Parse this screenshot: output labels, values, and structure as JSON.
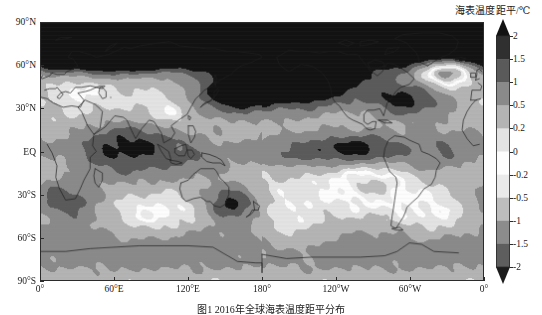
{
  "figure": {
    "caption": "图1  2016年全球海表温度距平分布",
    "colorbar_title": "海表温度距平/℃"
  },
  "axes": {
    "y_ticks": [
      {
        "label": "90°N",
        "value": 90
      },
      {
        "label": "60°N",
        "value": 60
      },
      {
        "label": "30°N",
        "value": 30
      },
      {
        "label": "EQ",
        "value": 0
      },
      {
        "label": "30°S",
        "value": -30
      },
      {
        "label": "60°S",
        "value": -60
      },
      {
        "label": "90°S",
        "value": -90
      }
    ],
    "x_ticks": [
      {
        "label": "0°",
        "value": 0
      },
      {
        "label": "60°E",
        "value": 60
      },
      {
        "label": "120°E",
        "value": 120
      },
      {
        "label": "180°",
        "value": 180
      },
      {
        "label": "120°W",
        "value": 240
      },
      {
        "label": "60°W",
        "value": 300
      },
      {
        "label": "0°",
        "value": 360
      }
    ]
  },
  "chart_data": {
    "type": "heatmap",
    "title": "海表温度距平/℃",
    "xlabel": "",
    "ylabel": "",
    "xlim": [
      0,
      360
    ],
    "ylim": [
      -90,
      90
    ],
    "grid": false,
    "projection": "equirectangular",
    "legend_position": "right",
    "colorbar": {
      "orientation": "vertical",
      "extend": "both",
      "units": "℃",
      "tick_labels": [
        "2",
        "1.5",
        "1",
        "0.5",
        "0.2",
        "0",
        "-0.2",
        "-0.5",
        "-1",
        "-1.5",
        "-2"
      ],
      "tick_values": [
        2,
        1.5,
        1,
        0.5,
        0.2,
        0,
        -0.2,
        -0.5,
        -1,
        -1.5,
        -2
      ],
      "levels": [
        -2,
        -1.5,
        -1,
        -0.5,
        -0.2,
        0,
        0.2,
        0.5,
        1,
        1.5,
        2
      ],
      "colors": [
        "#1c1c1c",
        "#3a3a3a",
        "#5e5e5e",
        "#8c8c8c",
        "#bdbdbd",
        "#eaeaea",
        "#fdfdfd",
        "#e3e3e3",
        "#b4b4b4",
        "#8a8a8a",
        "#5a5a5a",
        "#303030",
        "#121212"
      ],
      "band_labels": [
        "< -2",
        "-2 ~ -1.5",
        "-1.5 ~ -1",
        "-1 ~ -0.5",
        "-0.5 ~ -0.2",
        "-0.2 ~ 0",
        "0 ~ 0.2",
        "0.2 ~ 0.5",
        "0.5 ~ 1",
        "1 ~ 1.5",
        "1.5 ~ 2",
        "> 2"
      ]
    },
    "zonal_mean_anomaly": {
      "latitudes": [
        90,
        80,
        70,
        60,
        50,
        40,
        30,
        20,
        10,
        0,
        -10,
        -20,
        -30,
        -40,
        -50,
        -60,
        -70,
        -80,
        -90
      ],
      "values": [
        1.6,
        1.4,
        1.1,
        0.7,
        0.4,
        0.35,
        0.4,
        0.5,
        0.6,
        0.55,
        0.45,
        0.35,
        0.3,
        0.2,
        0.1,
        0.05,
        0.1,
        0.2,
        0.25
      ]
    },
    "notable_regions": [
      {
        "name": "Arctic",
        "anomaly": 2.0
      },
      {
        "name": "North Pacific",
        "anomaly": 1.0
      },
      {
        "name": "Equatorial Pacific",
        "anomaly": 0.5
      },
      {
        "name": "Southern Ocean",
        "anomaly": 0.2
      },
      {
        "name": "North Atlantic subpolar",
        "anomaly": -0.5
      }
    ]
  }
}
